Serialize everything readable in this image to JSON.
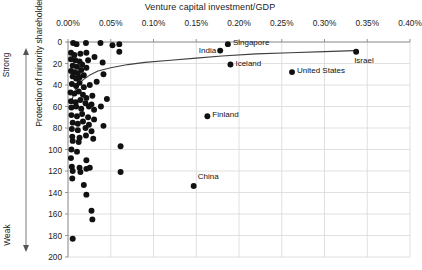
{
  "chart_data": {
    "type": "scatter",
    "title": "",
    "xlabel": "Venture capital investment/GDP",
    "ylabel": "Protection of minority shareholders ranking",
    "x_axis_position": "top",
    "y_axis_inverted": true,
    "xlim": [
      0.0,
      0.4
    ],
    "ylim": [
      0,
      200
    ],
    "grid": true,
    "legend": "none",
    "xticks": [
      "0.00%",
      "0.05%",
      "0.10%",
      "0.15%",
      "0.20%",
      "0.25%",
      "0.30%",
      "0.35%",
      "0.40%"
    ],
    "xtick_values": [
      0.0,
      0.05,
      0.1,
      0.15,
      0.2,
      0.25,
      0.3,
      0.35,
      0.4
    ],
    "yticks": [
      "0",
      "20",
      "40",
      "60",
      "80",
      "100",
      "120",
      "140",
      "160",
      "180",
      "200"
    ],
    "ytick_values": [
      0,
      20,
      40,
      60,
      80,
      100,
      120,
      140,
      160,
      180,
      200
    ],
    "axis_annotations": {
      "top_arrow_label": "Strong",
      "bottom_arrow_label": "Weak"
    },
    "marker_color": "#111111",
    "marker_size": 4.6,
    "gridline_color": "#d8d8d8",
    "trendline": {
      "type": "logarithmic",
      "color": "#3f3f3f",
      "points": [
        [
          0.004,
          57
        ],
        [
          0.006,
          50
        ],
        [
          0.009,
          44
        ],
        [
          0.013,
          39
        ],
        [
          0.018,
          35
        ],
        [
          0.025,
          31
        ],
        [
          0.035,
          27
        ],
        [
          0.05,
          24
        ],
        [
          0.07,
          21
        ],
        [
          0.09,
          19
        ],
        [
          0.12,
          17
        ],
        [
          0.15,
          15
        ],
        [
          0.18,
          13
        ],
        [
          0.22,
          11
        ],
        [
          0.26,
          10
        ],
        [
          0.3,
          9
        ],
        [
          0.335,
          8
        ]
      ]
    },
    "labeled_points": [
      {
        "name": "Singapore",
        "x": 0.187,
        "y": 2,
        "label_side": "right"
      },
      {
        "name": "India",
        "x": 0.178,
        "y": 8,
        "label_side": "left"
      },
      {
        "name": "Iceland",
        "x": 0.19,
        "y": 21,
        "label_side": "right"
      },
      {
        "name": "Israel",
        "x": 0.337,
        "y": 9,
        "label_side": "below-right"
      },
      {
        "name": "United States",
        "x": 0.262,
        "y": 28,
        "label_side": "right"
      },
      {
        "name": "Finland",
        "x": 0.163,
        "y": 69,
        "label_side": "right"
      },
      {
        "name": "China",
        "x": 0.147,
        "y": 134,
        "label_side": "above-right"
      }
    ],
    "unlabeled_points": [
      {
        "x": 0.006,
        "y": 1
      },
      {
        "x": 0.01,
        "y": 2
      },
      {
        "x": 0.021,
        "y": 1
      },
      {
        "x": 0.038,
        "y": 1
      },
      {
        "x": 0.052,
        "y": 3
      },
      {
        "x": 0.06,
        "y": 2
      },
      {
        "x": 0.06,
        "y": 9
      },
      {
        "x": 0.0035,
        "y": 10
      },
      {
        "x": 0.0075,
        "y": 12
      },
      {
        "x": 0.0145,
        "y": 11
      },
      {
        "x": 0.0215,
        "y": 10
      },
      {
        "x": 0.0035,
        "y": 16
      },
      {
        "x": 0.0085,
        "y": 17
      },
      {
        "x": 0.0135,
        "y": 18
      },
      {
        "x": 0.0055,
        "y": 22
      },
      {
        "x": 0.0105,
        "y": 23
      },
      {
        "x": 0.0165,
        "y": 21
      },
      {
        "x": 0.0215,
        "y": 24
      },
      {
        "x": 0.0035,
        "y": 27
      },
      {
        "x": 0.0075,
        "y": 28
      },
      {
        "x": 0.0115,
        "y": 29
      },
      {
        "x": 0.0155,
        "y": 26
      },
      {
        "x": 0.0235,
        "y": 17
      },
      {
        "x": 0.0055,
        "y": 32
      },
      {
        "x": 0.0095,
        "y": 34
      },
      {
        "x": 0.0135,
        "y": 33
      },
      {
        "x": 0.0185,
        "y": 31
      },
      {
        "x": 0.031,
        "y": 14
      },
      {
        "x": 0.0405,
        "y": 19
      },
      {
        "x": 0.0415,
        "y": 30
      },
      {
        "x": 0.0045,
        "y": 39
      },
      {
        "x": 0.0095,
        "y": 41
      },
      {
        "x": 0.0135,
        "y": 38
      },
      {
        "x": 0.0185,
        "y": 42
      },
      {
        "x": 0.0255,
        "y": 40
      },
      {
        "x": 0.0335,
        "y": 37
      },
      {
        "x": 0.003,
        "y": 47
      },
      {
        "x": 0.0075,
        "y": 48
      },
      {
        "x": 0.0125,
        "y": 46
      },
      {
        "x": 0.0175,
        "y": 49
      },
      {
        "x": 0.0215,
        "y": 52
      },
      {
        "x": 0.0285,
        "y": 50
      },
      {
        "x": 0.0035,
        "y": 55
      },
      {
        "x": 0.009,
        "y": 56
      },
      {
        "x": 0.0145,
        "y": 54
      },
      {
        "x": 0.0205,
        "y": 57
      },
      {
        "x": 0.0275,
        "y": 58
      },
      {
        "x": 0.004,
        "y": 61
      },
      {
        "x": 0.0095,
        "y": 60
      },
      {
        "x": 0.0155,
        "y": 62
      },
      {
        "x": 0.0245,
        "y": 60
      },
      {
        "x": 0.0305,
        "y": 63
      },
      {
        "x": 0.0385,
        "y": 60
      },
      {
        "x": 0.0455,
        "y": 53
      },
      {
        "x": 0.004,
        "y": 68
      },
      {
        "x": 0.0105,
        "y": 69
      },
      {
        "x": 0.0165,
        "y": 67
      },
      {
        "x": 0.0235,
        "y": 70
      },
      {
        "x": 0.0305,
        "y": 72
      },
      {
        "x": 0.0055,
        "y": 75
      },
      {
        "x": 0.0115,
        "y": 76
      },
      {
        "x": 0.0175,
        "y": 74
      },
      {
        "x": 0.0245,
        "y": 77
      },
      {
        "x": 0.0045,
        "y": 81
      },
      {
        "x": 0.0115,
        "y": 82
      },
      {
        "x": 0.0205,
        "y": 80
      },
      {
        "x": 0.0275,
        "y": 83
      },
      {
        "x": 0.0415,
        "y": 78
      },
      {
        "x": 0.005,
        "y": 88
      },
      {
        "x": 0.0135,
        "y": 89
      },
      {
        "x": 0.021,
        "y": 87
      },
      {
        "x": 0.0295,
        "y": 90
      },
      {
        "x": 0.0055,
        "y": 92
      },
      {
        "x": 0.0125,
        "y": 93
      },
      {
        "x": 0.004,
        "y": 100
      },
      {
        "x": 0.0105,
        "y": 102
      },
      {
        "x": 0.0615,
        "y": 97
      },
      {
        "x": 0.0035,
        "y": 108
      },
      {
        "x": 0.0215,
        "y": 110
      },
      {
        "x": 0.0045,
        "y": 116
      },
      {
        "x": 0.0135,
        "y": 117
      },
      {
        "x": 0.0215,
        "y": 118
      },
      {
        "x": 0.0255,
        "y": 117
      },
      {
        "x": 0.0055,
        "y": 120
      },
      {
        "x": 0.0145,
        "y": 121
      },
      {
        "x": 0.0615,
        "y": 121
      },
      {
        "x": 0.005,
        "y": 127
      },
      {
        "x": 0.0185,
        "y": 133
      },
      {
        "x": 0.0215,
        "y": 142
      },
      {
        "x": 0.0275,
        "y": 157
      },
      {
        "x": 0.0285,
        "y": 165
      },
      {
        "x": 0.0055,
        "y": 183
      }
    ]
  }
}
